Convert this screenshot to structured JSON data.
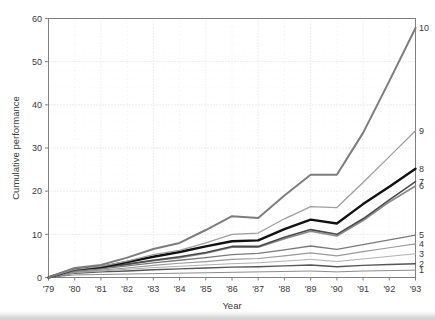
{
  "chart_data": {
    "type": "line",
    "title": "",
    "xlabel": "Year",
    "ylabel": "Cumulative performance",
    "x": [
      1979,
      1980,
      1981,
      1982,
      1983,
      1984,
      1985,
      1986,
      1987,
      1988,
      1989,
      1990,
      1991,
      1992,
      1993
    ],
    "xticklabels": [
      "'79",
      "'80",
      "'81",
      "'82",
      "'83",
      "'84",
      "'85",
      "'86",
      "'87",
      "'88",
      "'89",
      "'90",
      "'91",
      "'92",
      "'93"
    ],
    "yticklabels": [
      "0",
      "10",
      "20",
      "30",
      "40",
      "50",
      "60"
    ],
    "yticks": [
      0,
      10,
      20,
      30,
      40,
      50,
      60
    ],
    "xlim": [
      1979,
      1993
    ],
    "ylim": [
      0,
      60
    ],
    "grid": true,
    "grid_style": "dotted",
    "legend_position": "right-inline-labels",
    "series": [
      {
        "name": "1",
        "label": "1",
        "color": "#8c8c8c",
        "width": 1.0,
        "values": [
          0,
          0.6,
          0.7,
          0.8,
          0.9,
          1.0,
          1.1,
          1.2,
          1.3,
          1.4,
          1.5,
          1.3,
          1.5,
          1.6,
          1.7
        ]
      },
      {
        "name": "2",
        "label": "2",
        "color": "#555555",
        "width": 1.4,
        "values": [
          0,
          1.0,
          1.3,
          1.5,
          1.8,
          2.0,
          2.2,
          2.4,
          2.5,
          2.7,
          2.9,
          2.5,
          2.8,
          3.0,
          3.2
        ]
      },
      {
        "name": "3",
        "label": "3",
        "color": "#b0b0b0",
        "width": 1.0,
        "values": [
          0,
          1.1,
          1.5,
          1.9,
          2.3,
          2.6,
          2.9,
          3.2,
          3.4,
          3.8,
          4.2,
          3.7,
          4.3,
          4.9,
          5.5
        ]
      },
      {
        "name": "4",
        "label": "4",
        "color": "#9a9a9a",
        "width": 1.2,
        "values": [
          0,
          1.2,
          1.7,
          2.2,
          2.8,
          3.3,
          3.7,
          4.2,
          4.4,
          5.0,
          5.7,
          5.0,
          6.0,
          6.9,
          7.8
        ]
      },
      {
        "name": "5",
        "label": "5",
        "color": "#7a7a7a",
        "width": 1.3,
        "values": [
          0,
          1.4,
          2.0,
          2.7,
          3.4,
          4.0,
          4.6,
          5.3,
          5.6,
          6.4,
          7.3,
          6.5,
          7.6,
          8.7,
          9.8
        ]
      },
      {
        "name": "6",
        "label": "6",
        "color": "#8a8a8a",
        "width": 1.6,
        "values": [
          0,
          1.6,
          2.2,
          3.0,
          3.9,
          4.6,
          5.6,
          7.0,
          7.0,
          9.0,
          10.7,
          9.6,
          13.2,
          17.5,
          21.2
        ]
      },
      {
        "name": "7",
        "label": "7",
        "color": "#4a4a4a",
        "width": 1.6,
        "values": [
          0,
          1.7,
          2.3,
          3.1,
          4.0,
          4.8,
          5.8,
          7.2,
          7.2,
          9.3,
          11.1,
          10.0,
          13.6,
          18.0,
          22.2
        ]
      },
      {
        "name": "8",
        "label": "8",
        "color": "#111111",
        "width": 2.4,
        "values": [
          0,
          2.0,
          2.4,
          3.6,
          4.8,
          5.9,
          7.2,
          8.4,
          8.6,
          11.2,
          13.4,
          12.5,
          17.0,
          21.0,
          25.2
        ]
      },
      {
        "name": "9",
        "label": "9",
        "color": "#9e9e9e",
        "width": 1.3,
        "values": [
          0,
          1.9,
          2.6,
          3.8,
          5.3,
          6.3,
          8.0,
          10.0,
          10.3,
          13.6,
          16.4,
          16.2,
          22.0,
          28.0,
          34.0
        ]
      },
      {
        "name": "10",
        "label": "10",
        "color": "#7d7d7d",
        "width": 2.0,
        "values": [
          0,
          2.2,
          2.9,
          4.6,
          6.6,
          8.0,
          11.0,
          14.2,
          13.8,
          19.0,
          23.8,
          23.8,
          33.5,
          45.5,
          57.8
        ]
      }
    ]
  }
}
